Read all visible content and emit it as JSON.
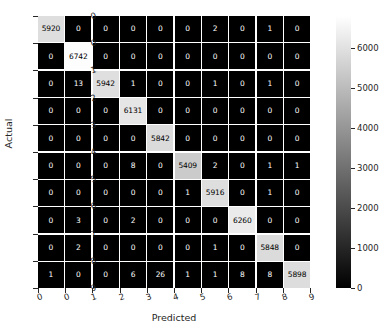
{
  "chart_data": {
    "type": "heatmap",
    "title": "",
    "xlabel": "Predicted",
    "ylabel": "Actual",
    "colormap": "gray",
    "grid": true,
    "legend_position": "right-colorbar",
    "categories": [
      "0",
      "1",
      "2",
      "3",
      "4",
      "5",
      "6",
      "7",
      "8",
      "9"
    ],
    "x_tick_labels": [
      "0",
      "0",
      "1",
      "2",
      "3",
      "4",
      "5",
      "6",
      "7",
      "8",
      "9"
    ],
    "y_tick_labels": [
      "0",
      "0",
      "1",
      "2",
      "3",
      "4",
      "5",
      "6",
      "7",
      "8",
      "9"
    ],
    "colorbar": {
      "ticks": [
        0,
        1000,
        2000,
        3000,
        4000,
        5000,
        6000
      ],
      "tick_labels": [
        "0",
        "1000",
        "2000",
        "3000",
        "4000",
        "5000",
        "6000"
      ],
      "vmin": 0,
      "vmax": 6800
    },
    "zlim": [
      0,
      6800
    ],
    "matrix": [
      [
        5920,
        0,
        0,
        0,
        0,
        0,
        2,
        0,
        1,
        0
      ],
      [
        0,
        6742,
        0,
        0,
        0,
        0,
        0,
        0,
        0,
        0
      ],
      [
        0,
        13,
        5942,
        1,
        0,
        0,
        1,
        0,
        1,
        0
      ],
      [
        0,
        0,
        0,
        6131,
        0,
        0,
        0,
        0,
        0,
        0
      ],
      [
        0,
        0,
        0,
        0,
        5842,
        0,
        0,
        0,
        0,
        0
      ],
      [
        0,
        0,
        0,
        8,
        0,
        5409,
        2,
        0,
        1,
        1
      ],
      [
        0,
        0,
        0,
        0,
        0,
        1,
        5916,
        0,
        1,
        0
      ],
      [
        0,
        3,
        0,
        2,
        0,
        0,
        0,
        6260,
        0,
        0
      ],
      [
        0,
        2,
        0,
        0,
        0,
        0,
        1,
        0,
        5848,
        0
      ],
      [
        1,
        0,
        0,
        6,
        26,
        1,
        1,
        8,
        8,
        5898
      ]
    ]
  }
}
